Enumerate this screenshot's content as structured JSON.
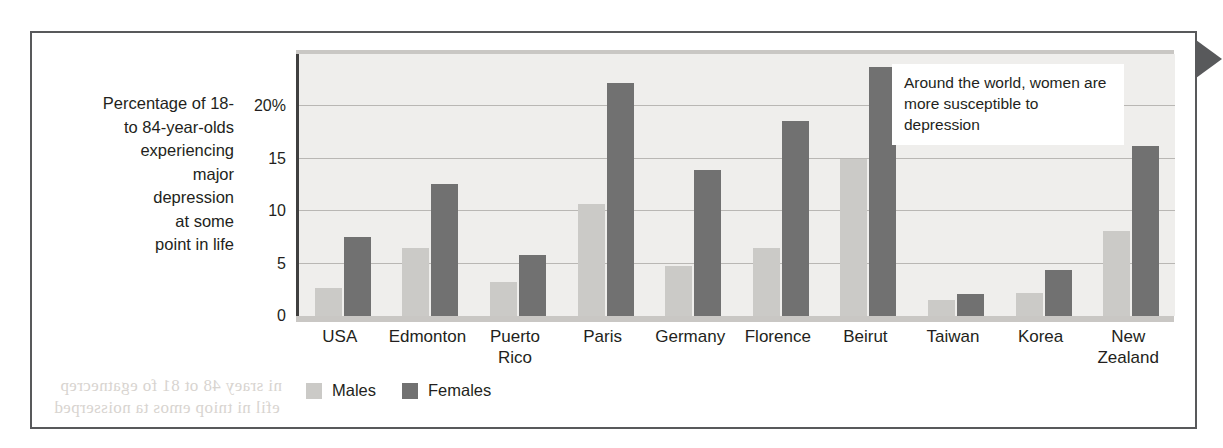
{
  "figure": {
    "axis_title_lines": [
      "Percentage of 18-",
      "to 84-year-olds",
      "experiencing",
      "major",
      "depression",
      "at some",
      "point in life"
    ],
    "annotation": "Around the world, women are more susceptible to depression",
    "page_marker_icon": "triangle-right-icon",
    "bleed_through": [
      "ni sraey 48 ot 81 fo egatnecrep",
      "efil ni tniop emos ta noisserped",
      "dlrow eht dnuora",
      "noisserped ot elbitpecsus"
    ]
  },
  "colors": {
    "males": "#cbcac7",
    "females": "#717171",
    "plot_background": "#efeeec",
    "frame": "#58595b",
    "gridline": "#b9b7b4",
    "text": "#231f20"
  },
  "chart_data": {
    "type": "bar",
    "title": "",
    "xlabel": "",
    "ylabel": "Percentage of 18- to 84-year-olds experiencing major depression at some point in life",
    "ylim": [
      0,
      25
    ],
    "yticks": [
      0,
      5,
      10,
      15,
      20
    ],
    "ytick_labels": [
      "0",
      "5",
      "10",
      "15",
      "20%"
    ],
    "grid": true,
    "legend_position": "bottom-left",
    "categories": [
      "USA",
      "Edmonton",
      "Puerto Rico",
      "Paris",
      "Germany",
      "Florence",
      "Beirut",
      "Taiwan",
      "Korea",
      "New Zealand"
    ],
    "series": [
      {
        "name": "Males",
        "color": "#cbcac7",
        "values": [
          2.7,
          6.5,
          3.2,
          10.7,
          4.8,
          6.5,
          15.0,
          1.5,
          2.2,
          8.1
        ]
      },
      {
        "name": "Females",
        "color": "#717171",
        "values": [
          7.5,
          12.6,
          5.8,
          22.2,
          13.9,
          18.6,
          23.8,
          2.1,
          4.4,
          16.2
        ]
      }
    ],
    "annotations": [
      {
        "text": "Around the world, women are more susceptible to depression",
        "x": "Beirut",
        "position": "upper-right"
      }
    ]
  }
}
